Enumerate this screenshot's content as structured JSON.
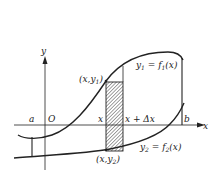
{
  "diagram": {
    "axes": {
      "x_label": "x",
      "y_label": "y",
      "origin_label": "O"
    },
    "bounds": {
      "a_label": "a",
      "b_label": "b"
    },
    "strip": {
      "left_label": "x",
      "right_label": "x + Δx",
      "top_point": "(x,y1)",
      "top_point_base": "(x,y",
      "top_point_sub": "1",
      "bottom_point": "(x,y2)",
      "bottom_point_base": "(x,y",
      "bottom_point_sub": "2",
      "fill": "hatched"
    },
    "curves": [
      {
        "name": "upper",
        "label": "y1 = f1(x)",
        "y": "y",
        "ysub": "1",
        "eq": " = f",
        "fsub": "1",
        "arg": "(x)"
      },
      {
        "name": "lower",
        "label": "y2 = f2(x)",
        "y": "y",
        "ysub": "2",
        "eq": " = f",
        "fsub": "2",
        "arg": "(x)"
      }
    ],
    "colors": {
      "stroke": "#222222",
      "background": "#ffffff",
      "hatch": "#555555"
    }
  }
}
